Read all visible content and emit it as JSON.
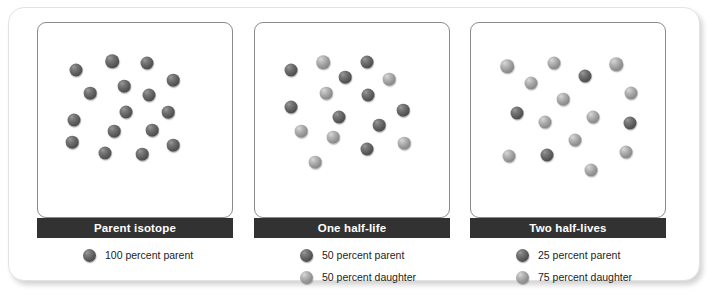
{
  "figure": {
    "colors": {
      "parent_sphere": "#5e5e5e",
      "daughter_sphere": "#989898",
      "title_bar_background": "#323232",
      "title_bar_text": "#ffffff",
      "panel_border": "#8b8b8b",
      "card_background": "#ffffff"
    }
  },
  "chart_data": {
    "type": "diagram",
    "categories": [
      "Parent isotope",
      "One half-life",
      "Two half-lives"
    ],
    "series": [
      {
        "name": "percent parent",
        "values": [
          100,
          50,
          25
        ]
      },
      {
        "name": "percent daughter",
        "values": [
          0,
          50,
          75
        ]
      }
    ],
    "total_spheres_per_panel": 16,
    "panel_sphere_counts": [
      {
        "panel": "Parent isotope",
        "parent": 16,
        "daughter": 0
      },
      {
        "panel": "One half-life",
        "parent": 8,
        "daughter": 8
      },
      {
        "panel": "Two half-lives",
        "parent": 4,
        "daughter": 12
      }
    ]
  },
  "panels": [
    {
      "title": "Parent isotope",
      "legend": [
        {
          "label": "100 percent parent",
          "kind": "parent"
        }
      ],
      "spheres": [
        {
          "x": 16,
          "y": 19,
          "r": 6.5,
          "kind": "parent"
        },
        {
          "x": 52,
          "y": 10,
          "r": 6.8,
          "kind": "parent"
        },
        {
          "x": 87,
          "y": 12,
          "r": 6.5,
          "kind": "parent"
        },
        {
          "x": 113,
          "y": 29,
          "r": 6.3,
          "kind": "parent"
        },
        {
          "x": 64,
          "y": 35,
          "r": 6.3,
          "kind": "parent"
        },
        {
          "x": 30,
          "y": 42,
          "r": 6.3,
          "kind": "parent"
        },
        {
          "x": 89,
          "y": 44,
          "r": 6.5,
          "kind": "parent"
        },
        {
          "x": 66,
          "y": 61,
          "r": 6.5,
          "kind": "parent"
        },
        {
          "x": 108,
          "y": 61,
          "r": 6.3,
          "kind": "parent"
        },
        {
          "x": 14,
          "y": 69,
          "r": 6.5,
          "kind": "parent"
        },
        {
          "x": 54,
          "y": 80,
          "r": 6.3,
          "kind": "parent"
        },
        {
          "x": 92,
          "y": 79,
          "r": 6.3,
          "kind": "parent"
        },
        {
          "x": 12,
          "y": 91,
          "r": 6.3,
          "kind": "parent"
        },
        {
          "x": 45,
          "y": 102,
          "r": 6.5,
          "kind": "parent"
        },
        {
          "x": 82,
          "y": 103,
          "r": 6.3,
          "kind": "parent"
        },
        {
          "x": 113,
          "y": 94,
          "r": 6.3,
          "kind": "parent"
        }
      ]
    },
    {
      "title": "One half-life",
      "legend": [
        {
          "label": "50 percent parent",
          "kind": "parent"
        },
        {
          "label": "50 percent daughter",
          "kind": "daughter"
        }
      ],
      "spheres": [
        {
          "x": 14,
          "y": 19,
          "r": 6.5,
          "kind": "parent"
        },
        {
          "x": 46,
          "y": 11,
          "r": 6.8,
          "kind": "daughter"
        },
        {
          "x": 90,
          "y": 11,
          "r": 6.5,
          "kind": "parent"
        },
        {
          "x": 68,
          "y": 26,
          "r": 6.3,
          "kind": "parent"
        },
        {
          "x": 112,
          "y": 28,
          "r": 6.3,
          "kind": "daughter"
        },
        {
          "x": 49,
          "y": 42,
          "r": 6.3,
          "kind": "daughter"
        },
        {
          "x": 91,
          "y": 44,
          "r": 6.5,
          "kind": "parent"
        },
        {
          "x": 14,
          "y": 56,
          "r": 6.5,
          "kind": "parent"
        },
        {
          "x": 126,
          "y": 59,
          "r": 6.3,
          "kind": "parent"
        },
        {
          "x": 62,
          "y": 66,
          "r": 6.5,
          "kind": "parent"
        },
        {
          "x": 102,
          "y": 74,
          "r": 6.3,
          "kind": "parent"
        },
        {
          "x": 24,
          "y": 80,
          "r": 6.3,
          "kind": "daughter"
        },
        {
          "x": 56,
          "y": 86,
          "r": 6.3,
          "kind": "daughter"
        },
        {
          "x": 127,
          "y": 92,
          "r": 6.3,
          "kind": "daughter"
        },
        {
          "x": 90,
          "y": 98,
          "r": 6.5,
          "kind": "parent"
        },
        {
          "x": 38,
          "y": 111,
          "r": 6.3,
          "kind": "daughter"
        }
      ]
    },
    {
      "title": "Two half-lives",
      "legend": [
        {
          "label": "25 percent parent",
          "kind": "parent"
        },
        {
          "label": "75 percent daughter",
          "kind": "daughter"
        }
      ],
      "spheres": [
        {
          "x": 14,
          "y": 15,
          "r": 6.8,
          "kind": "daughter"
        },
        {
          "x": 61,
          "y": 12,
          "r": 6.5,
          "kind": "daughter"
        },
        {
          "x": 123,
          "y": 13,
          "r": 6.8,
          "kind": "daughter"
        },
        {
          "x": 92,
          "y": 25,
          "r": 6.5,
          "kind": "parent"
        },
        {
          "x": 38,
          "y": 32,
          "r": 6.5,
          "kind": "daughter"
        },
        {
          "x": 138,
          "y": 42,
          "r": 6.5,
          "kind": "daughter"
        },
        {
          "x": 70,
          "y": 48,
          "r": 6.3,
          "kind": "daughter"
        },
        {
          "x": 24,
          "y": 62,
          "r": 6.5,
          "kind": "parent"
        },
        {
          "x": 100,
          "y": 66,
          "r": 6.5,
          "kind": "daughter"
        },
        {
          "x": 52,
          "y": 71,
          "r": 6.5,
          "kind": "daughter"
        },
        {
          "x": 137,
          "y": 72,
          "r": 6.5,
          "kind": "parent"
        },
        {
          "x": 82,
          "y": 89,
          "r": 6.5,
          "kind": "daughter"
        },
        {
          "x": 16,
          "y": 105,
          "r": 6.5,
          "kind": "daughter"
        },
        {
          "x": 54,
          "y": 104,
          "r": 6.5,
          "kind": "parent"
        },
        {
          "x": 133,
          "y": 101,
          "r": 6.5,
          "kind": "daughter"
        },
        {
          "x": 98,
          "y": 119,
          "r": 6.5,
          "kind": "daughter"
        }
      ]
    }
  ]
}
